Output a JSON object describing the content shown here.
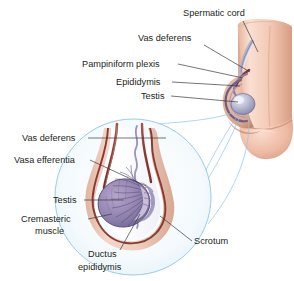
{
  "figure": {
    "background": "#ffffff",
    "width": 294,
    "height": 281
  },
  "upper_diagram": {
    "name": "external-genitalia-overview",
    "description": "Lateral view of penis and scrotum showing spermatic cord, vas deferens, pampiniform plexus, epididymis and testis",
    "labels": [
      {
        "id": "spermatic-cord",
        "text": "Spermatic cord",
        "x": 183,
        "y": 16,
        "anchor": "start",
        "leader": "M 243,21 L 258,52"
      },
      {
        "id": "vas-deferens-upper",
        "text": "Vas deferens",
        "x": 138,
        "y": 41,
        "anchor": "start",
        "leader": "M 204,45 L 250,72"
      },
      {
        "id": "pampiniform-plexis",
        "text": "Pampiniform plexis",
        "x": 82,
        "y": 67,
        "anchor": "start",
        "leader": "M 178,64 L 248,77"
      },
      {
        "id": "epididymis-upper",
        "text": "Epididymis",
        "x": 116,
        "y": 85,
        "anchor": "start",
        "leader": "M 172,82 L 245,84"
      },
      {
        "id": "testis-upper",
        "text": "Testis",
        "x": 141,
        "y": 99,
        "anchor": "start",
        "leader": "M 171,96 L 245,99"
      }
    ]
  },
  "lower_diagram": {
    "name": "testis-cross-section-magnified",
    "description": "Magnified circular inset of the scrotum and testis in cross section",
    "labels": [
      {
        "id": "vas-deferens-lower",
        "text": "Vas deferens",
        "x": 22,
        "y": 141,
        "anchor": "start",
        "leader": "M 88,138 L 166,138"
      },
      {
        "id": "vasa-efferentia",
        "text": "Vasa efferentia",
        "x": 14,
        "y": 163,
        "anchor": "start",
        "leader": "M 90,160 L 146,183"
      },
      {
        "id": "testis-lower",
        "text": "Testis",
        "x": 53,
        "y": 203,
        "anchor": "start",
        "leader": "M 84,200 L 127,200"
      },
      {
        "id": "cremasteric-muscle-line1",
        "text": "Cremasteric",
        "x": 21,
        "y": 222,
        "anchor": "start",
        "leader": "M 88,219 L 116,214"
      },
      {
        "id": "cremasteric-muscle-line2",
        "text": "muscle",
        "x": 35,
        "y": 234,
        "anchor": "start",
        "leader": ""
      },
      {
        "id": "ductus-epididymis-line1",
        "text": "Ductus",
        "x": 88,
        "y": 257,
        "anchor": "start",
        "leader": "M 120,250 L 153,220"
      },
      {
        "id": "ductus-epididymis-line2",
        "text": "epididymis",
        "x": 78,
        "y": 270,
        "anchor": "start",
        "leader": ""
      },
      {
        "id": "scrotum",
        "text": "Scrotum",
        "x": 194,
        "y": 244,
        "anchor": "start",
        "leader": "M 192,241 L 163,220"
      }
    ]
  },
  "colors": {
    "text": "#231f20",
    "leader_line": "#3b3b3b",
    "magnify_line": "#8fc6e4",
    "circle_outline": "#8fc6e4",
    "skin_light": "#f3cdbc",
    "skin_mid": "#e8b8a4",
    "skin_dark": "#d79c85",
    "scrotum_skin": "#e9c4b4",
    "tunica_dark": "#8a3a33",
    "vas_deferens": "#9a4038",
    "testis_purple": "#8d7aa8",
    "testis_purple_dark": "#6e5b8c",
    "plexus_purple": "#9b92bd",
    "inset_fill": "#eef6fb"
  }
}
